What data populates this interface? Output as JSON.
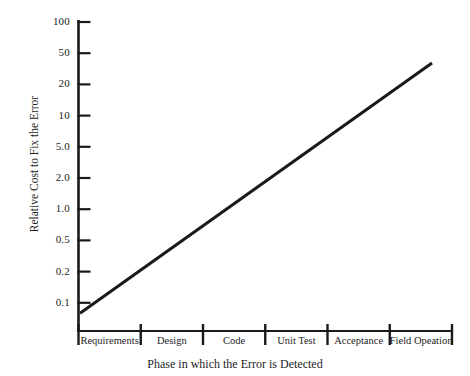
{
  "chart_data": {
    "type": "line",
    "title": "",
    "xlabel": "Phase in which the Error is Detected",
    "ylabel": "Relative Cost to Fix the Error",
    "yscale": "log",
    "ylim": [
      0.1,
      100
    ],
    "grid": false,
    "legend": null,
    "categories": [
      "Requirements",
      "Design",
      "Code",
      "Unit Test",
      "Acceptance",
      "Field Opeation"
    ],
    "ytick_labels": [
      "100",
      "50",
      "20",
      "10",
      "5.0",
      "2.0",
      "1.0",
      "0.5",
      "0.2",
      "0.1"
    ],
    "ytick_values": [
      100,
      50,
      20,
      10,
      5.0,
      2.0,
      1.0,
      0.5,
      0.2,
      0.1
    ],
    "series": [
      {
        "name": "Relative cost to fix an error",
        "x": [
          "Requirements",
          "Design",
          "Code",
          "Unit Test",
          "Acceptance",
          "Field Opeation"
        ],
        "values": [
          0.13,
          0.35,
          0.9,
          2.4,
          6.5,
          30
        ],
        "color": "#1a1a1a",
        "line_width": 3
      }
    ]
  },
  "axes": {
    "y_title": "Relative Cost to Fix the Error",
    "x_title": "Phase in which the Error is Detected"
  }
}
